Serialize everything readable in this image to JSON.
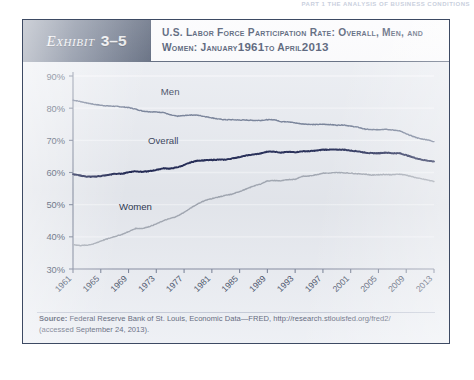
{
  "page_header": {
    "running_head": "PART 1  THE ANALYSIS OF BUSINESS CONDITIONS",
    "running_head_sub": ""
  },
  "exhibit": {
    "tag_word": "Exhibit",
    "tag_number": "3–5",
    "title_line1": "U.S. Labor Force Participation Rate: Overall, Men, and",
    "title_line2_a": "Women: January",
    "title_line2_year1": "1961",
    "title_line2_b": "to April",
    "title_line2_year2": "2013"
  },
  "source": {
    "label": "Source:",
    "line1": " Federal Reserve Bank of St. Louis, Economic Data—FRED, http://research.stlouisfed.org/fred2/",
    "line2": "(accessed September 24, 2013)."
  },
  "series_labels": {
    "men": "Men",
    "overall": "Overall",
    "women": "Women"
  },
  "colors": {
    "men_line": "#6a7690",
    "overall_line": "#1b2350",
    "women_line": "#a3a9b4",
    "axis": "#6f7990",
    "gridline": "#f4f6fa",
    "tag_background": "#4b5872",
    "frame": "#3d4a63",
    "plot_background": "#e9ecf2",
    "tick_text": "#2f3a55"
  },
  "chart_data": {
    "type": "line",
    "xlabel": "",
    "ylabel": "",
    "ylim": [
      30,
      90
    ],
    "yticks": [
      30,
      40,
      50,
      60,
      70,
      80,
      90
    ],
    "ytick_labels": [
      "30%",
      "40%",
      "50%",
      "60%",
      "70%",
      "80%",
      "90%"
    ],
    "xlim": [
      1961,
      2013
    ],
    "xticks": [
      1961,
      1965,
      1969,
      1973,
      1977,
      1981,
      1985,
      1989,
      1993,
      1997,
      2001,
      2005,
      2009,
      2013
    ],
    "xtick_labels": [
      "1961",
      "1965",
      "1969",
      "1973",
      "1977",
      "1981",
      "1985",
      "1989",
      "1993",
      "1997",
      "2001",
      "2005",
      "2009",
      "2013"
    ],
    "xtick_rotation": 45,
    "grid": true,
    "legend": "inline-labels",
    "units": "percent",
    "x": [
      1961,
      1962,
      1963,
      1964,
      1965,
      1966,
      1967,
      1968,
      1969,
      1970,
      1971,
      1972,
      1973,
      1974,
      1975,
      1976,
      1977,
      1978,
      1979,
      1980,
      1981,
      1982,
      1983,
      1984,
      1985,
      1986,
      1987,
      1988,
      1989,
      1990,
      1991,
      1992,
      1993,
      1994,
      1995,
      1996,
      1997,
      1998,
      1999,
      2000,
      2001,
      2002,
      2003,
      2004,
      2005,
      2006,
      2007,
      2008,
      2009,
      2010,
      2011,
      2012,
      2013
    ],
    "series": [
      {
        "name": "Men",
        "color": "#6a7690",
        "values": [
          82.5,
          82.1,
          81.6,
          81.2,
          80.9,
          80.7,
          80.6,
          80.4,
          80.2,
          79.7,
          79.1,
          78.9,
          78.8,
          78.7,
          77.9,
          77.5,
          77.7,
          77.9,
          77.8,
          77.4,
          77.0,
          76.6,
          76.4,
          76.4,
          76.3,
          76.3,
          76.2,
          76.2,
          76.4,
          76.4,
          75.8,
          75.8,
          75.4,
          75.1,
          75.0,
          74.9,
          75.0,
          74.9,
          74.7,
          74.8,
          74.4,
          74.1,
          73.5,
          73.3,
          73.3,
          73.5,
          73.2,
          73.0,
          72.0,
          71.2,
          70.5,
          70.2,
          69.6
        ]
      },
      {
        "name": "Overall",
        "color": "#1b2350",
        "values": [
          59.5,
          59.1,
          58.7,
          58.7,
          58.9,
          59.2,
          59.6,
          59.6,
          60.1,
          60.4,
          60.2,
          60.4,
          60.8,
          61.3,
          61.2,
          61.6,
          62.3,
          63.2,
          63.7,
          63.8,
          63.9,
          64.0,
          64.0,
          64.4,
          64.8,
          65.3,
          65.6,
          65.9,
          66.5,
          66.5,
          66.2,
          66.4,
          66.3,
          66.6,
          66.6,
          66.8,
          67.1,
          67.1,
          67.1,
          67.1,
          66.8,
          66.6,
          66.2,
          66.0,
          66.0,
          66.2,
          66.0,
          66.0,
          65.4,
          64.7,
          64.1,
          63.7,
          63.4
        ]
      },
      {
        "name": "Women",
        "color": "#a3a9b4",
        "values": [
          37.6,
          37.3,
          37.4,
          37.8,
          38.7,
          39.4,
          40.1,
          40.7,
          41.6,
          42.6,
          42.6,
          43.2,
          44.0,
          45.0,
          45.7,
          46.4,
          47.6,
          49.0,
          50.3,
          51.3,
          51.9,
          52.4,
          52.9,
          53.3,
          54.1,
          54.9,
          55.8,
          56.4,
          57.4,
          57.5,
          57.4,
          57.8,
          57.9,
          58.8,
          58.9,
          59.3,
          59.8,
          59.8,
          60.0,
          59.9,
          59.8,
          59.6,
          59.5,
          59.2,
          59.3,
          59.4,
          59.3,
          59.5,
          59.2,
          58.6,
          58.1,
          57.7,
          57.2
        ]
      }
    ]
  }
}
